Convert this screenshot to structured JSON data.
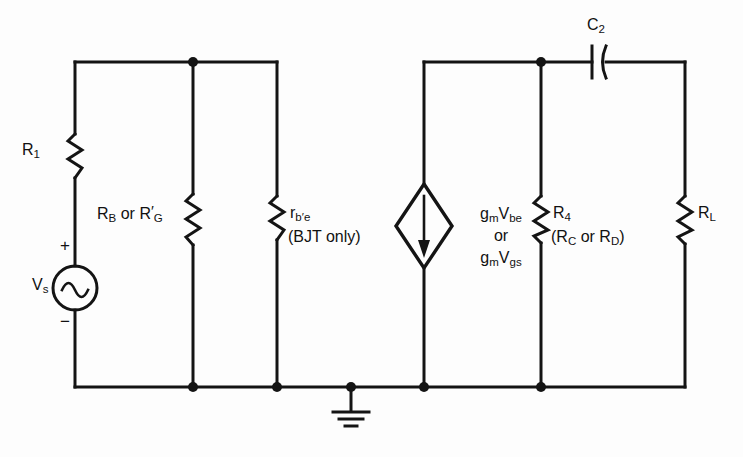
{
  "figure": {
    "type": "circuit-schematic",
    "line_color": "#141414",
    "background_color": "#fdfdfd"
  },
  "components": {
    "r1": {
      "name": "R1",
      "symbol": "resistor",
      "label_main": "R",
      "label_sub": "1"
    },
    "rb_rg": {
      "name": "RB-or-RGprime",
      "symbol": "resistor",
      "label_parts": [
        {
          "main": "R",
          "sub": "B"
        },
        {
          "text": " or "
        },
        {
          "main": "R",
          "prime": "′",
          "sub": "G"
        }
      ],
      "label_plain": "RB or R'G"
    },
    "rbe": {
      "name": "r-b-prime-e",
      "symbol": "resistor",
      "label_main": "r",
      "label_sub": "b′e",
      "label_note": "(BJT only)"
    },
    "source_vs": {
      "name": "Vs",
      "symbol": "ac-voltage-source",
      "label_main": "V",
      "label_sub": "s",
      "plus_sign": "+",
      "minus_sign": "−"
    },
    "dependent_source": {
      "name": "gm-controlled-current-source",
      "symbol": "diamond-current-source",
      "current_direction": "down",
      "line1": {
        "main": "g",
        "sub": "m",
        "main2": "V",
        "sub2": "be"
      },
      "line2": "or",
      "line3": {
        "main": "g",
        "sub": "m",
        "main2": "V",
        "sub2": "gs"
      },
      "label_plain": "gmVbe or gmVgs"
    },
    "r4": {
      "name": "R4",
      "symbol": "resistor",
      "label_main": "R",
      "label_sub": "4",
      "label_note_parts": [
        {
          "text": "("
        },
        {
          "main": "R",
          "sub": "C"
        },
        {
          "text": " or "
        },
        {
          "main": "R",
          "sub": "D"
        },
        {
          "text": ")"
        }
      ],
      "label_note_plain": "(RC or RD)"
    },
    "c2": {
      "name": "C2",
      "symbol": "capacitor",
      "label_main": "C",
      "label_sub": "2"
    },
    "rl": {
      "name": "RL",
      "symbol": "resistor",
      "label_main": "R",
      "label_sub": "L"
    },
    "ground": {
      "name": "ground",
      "symbol": "earth-ground"
    }
  },
  "texts": {
    "r1": "R",
    "r1_sub": "1",
    "rb": "R",
    "rb_sub": "B",
    "or_1": " or ",
    "rg": "R",
    "rg_prime": "′",
    "rg_sub": "G",
    "rbe": "r",
    "rbe_sub": "b′e",
    "bjt_only": "(BJT only)",
    "vs": "V",
    "vs_sub": "s",
    "plus": "+",
    "minus": "−",
    "gm1": "g",
    "gm1_sub": "m",
    "v1": "V",
    "v1_sub": "be",
    "or_2": "or",
    "gm2": "g",
    "gm2_sub": "m",
    "v2": "V",
    "v2_sub": "gs",
    "r4": "R",
    "r4_sub": "4",
    "paren_open": "(",
    "rc": "R",
    "rc_sub": "C",
    "or_3": " or ",
    "rd": "R",
    "rd_sub": "D",
    "paren_close": ")",
    "c2": "C",
    "c2_sub": "2",
    "rl": "R",
    "rl_sub": "L"
  },
  "geometry": {
    "top_rail_y": 62,
    "bottom_rail_y": 387,
    "left_x": 75,
    "node_rb_x": 193,
    "node_rbe_x": 277,
    "ground_x": 351,
    "source_x": 424,
    "node_r4_x": 541,
    "right_x": 685,
    "cap_x": 598
  }
}
